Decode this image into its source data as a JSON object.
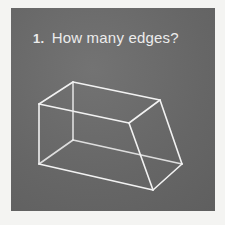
{
  "question": {
    "number": "1.",
    "text": "How many edges?"
  },
  "figure": {
    "line_color": "#f2f2f2",
    "vertices": {
      "back_top_left": [
        73,
        82
      ],
      "back_top_right": [
        160,
        100
      ],
      "back_bottom_left": [
        73,
        140
      ],
      "back_bottom_right": [
        182,
        164
      ],
      "front_top_left": [
        39,
        104
      ],
      "front_top_right": [
        129,
        123
      ],
      "front_bottom_left": [
        39,
        164
      ],
      "front_bottom_right": [
        153,
        190
      ]
    }
  },
  "colors": {
    "panel": "#6b6b6b",
    "background": "#f4f4f2",
    "text": "#ececec"
  }
}
